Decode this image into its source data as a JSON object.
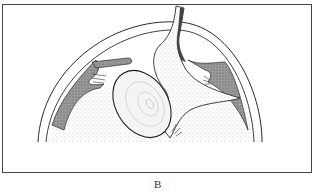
{
  "figure": {
    "panel_label": "B",
    "colors": {
      "ink": "#2a2a2a",
      "shade": "#7a7a7a",
      "stipple": "#d8d8d8",
      "background": "#ffffff"
    }
  }
}
